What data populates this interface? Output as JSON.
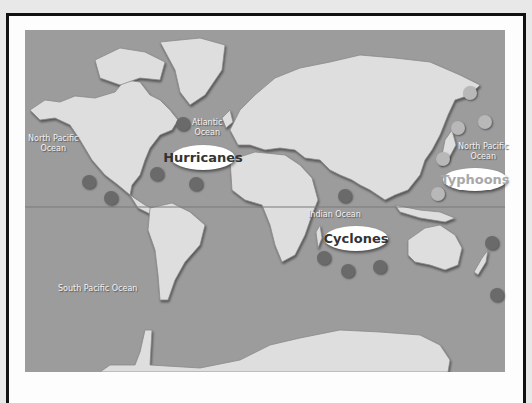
{
  "map": {
    "colors": {
      "ocean": "#9c9c9c",
      "land": "#dedede",
      "equator": "#7a7a7a",
      "storm_dark": "#6a6a6a",
      "storm_light": "#b8b8b8"
    },
    "ocean_labels": [
      {
        "id": "north-pacific-west",
        "text": "North Pacific\nOcean"
      },
      {
        "id": "atlantic",
        "text": "Atlantic\nOcean"
      },
      {
        "id": "north-pacific-east",
        "text": "North Pacific\nOcean"
      },
      {
        "id": "indian",
        "text": "Indian Ocean"
      },
      {
        "id": "south-pacific",
        "text": "South Pacific Ocean"
      }
    ],
    "storm_labels": {
      "hurricanes": "Hurricanes",
      "typhoons": "Typhoons",
      "cyclones": "Cyclones"
    },
    "storm_markers": {
      "hurricanes": [
        [
          183,
          124
        ],
        [
          89,
          182
        ],
        [
          111,
          198
        ],
        [
          157,
          174
        ],
        [
          196,
          184
        ]
      ],
      "typhoons": [
        [
          470,
          93
        ],
        [
          458,
          128
        ],
        [
          485,
          122
        ],
        [
          443,
          159
        ],
        [
          438,
          194
        ]
      ],
      "cyclones": [
        [
          345,
          196
        ],
        [
          324,
          258
        ],
        [
          348,
          271
        ],
        [
          380,
          267
        ],
        [
          492,
          243
        ],
        [
          497,
          295
        ]
      ]
    }
  }
}
